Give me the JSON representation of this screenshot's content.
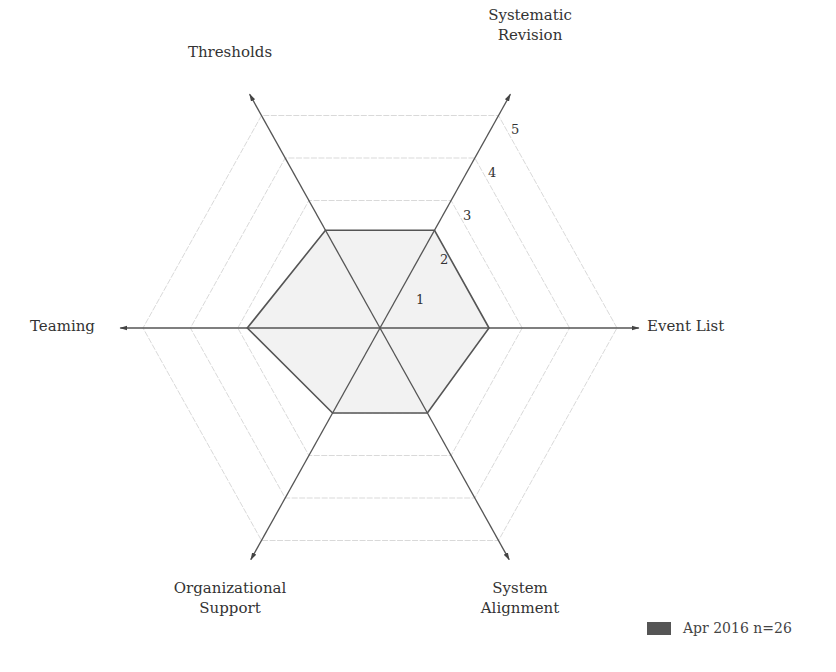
{
  "chart_data": {
    "type": "radar",
    "title": "",
    "axes": [
      "Event List",
      "Systematic Revision",
      "Thresholds",
      "Teaming",
      "Organizational Support",
      "System Alignment"
    ],
    "axis_labels_display": {
      "event_list": "Event List",
      "systematic_revision": [
        "Systematic",
        "Revision"
      ],
      "thresholds": "Thresholds",
      "teaming": "Teaming",
      "organizational_support": [
        "Organizational",
        "Support"
      ],
      "system_alignment": [
        "System",
        "Alignment"
      ]
    },
    "rlim": [
      0,
      5
    ],
    "ticks": [
      "1",
      "2",
      "3",
      "4",
      "5"
    ],
    "grid": true,
    "legend_position": "bottom-right",
    "series": [
      {
        "name": "Apr 2016 n=26",
        "color": "#555555",
        "fill": "#f2f2f2",
        "values": [
          2.3,
          2.3,
          2.3,
          2.8,
          2.0,
          2.0
        ]
      }
    ]
  },
  "legend": {
    "label": "Apr 2016 n=26",
    "swatch_color": "#555555"
  },
  "tick_labels": [
    "1",
    "2",
    "3",
    "4",
    "5"
  ]
}
